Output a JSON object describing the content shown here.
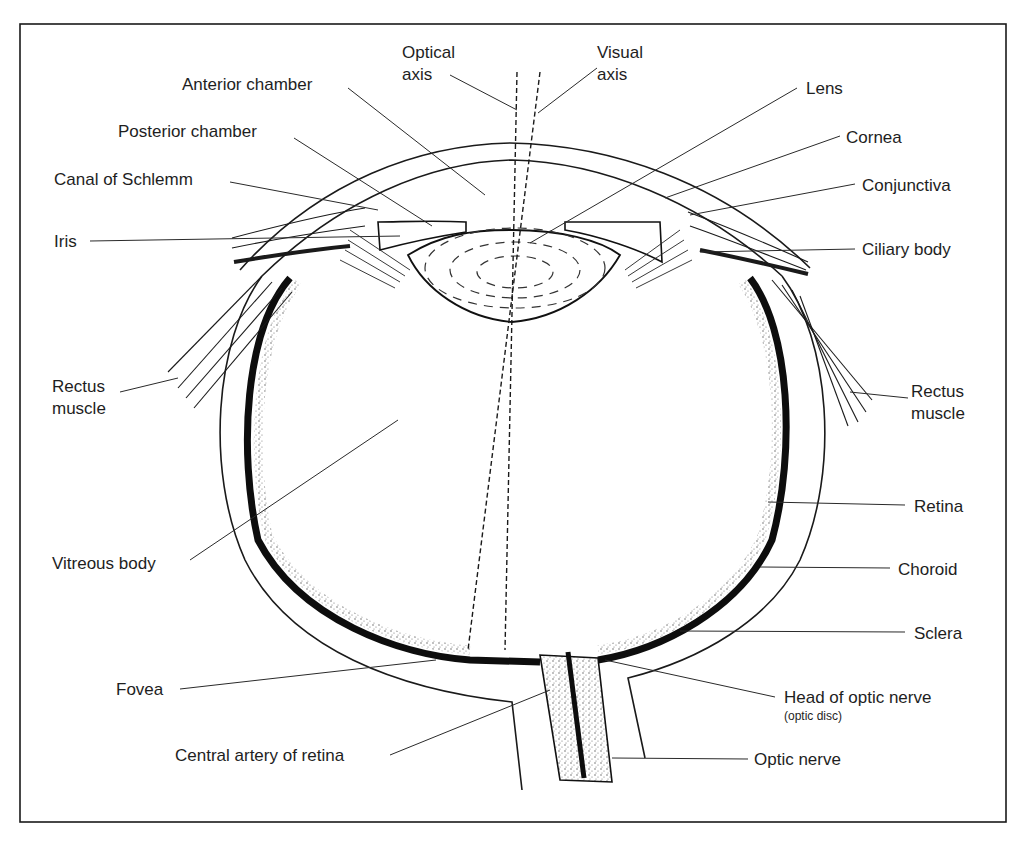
{
  "figure": {
    "frame": {
      "stroke": "#1a1a1a",
      "background": "#ffffff"
    }
  },
  "labels": {
    "optical_axis": {
      "line1": "Optical",
      "line2": "axis"
    },
    "visual_axis": {
      "line1": "Visual",
      "line2": "axis"
    },
    "anterior_chamber": "Anterior chamber",
    "posterior_chamber": "Posterior chamber",
    "canal_of_schlemm": "Canal of Schlemm",
    "iris": "Iris",
    "rectus_muscle_left": {
      "line1": "Rectus",
      "line2": "muscle"
    },
    "vitreous_body": "Vitreous body",
    "fovea": "Fovea",
    "central_artery": "Central artery of retina",
    "lens": "Lens",
    "cornea": "Cornea",
    "conjunctiva": "Conjunctiva",
    "ciliary_body": "Ciliary body",
    "rectus_muscle_right": {
      "line1": "Rectus",
      "line2": "muscle"
    },
    "retina": "Retina",
    "choroid": "Choroid",
    "sclera": "Sclera",
    "head_of_optic_nerve": "Head of optic nerve",
    "optic_disc_note": "(optic disc)",
    "optic_nerve": "Optic nerve"
  }
}
